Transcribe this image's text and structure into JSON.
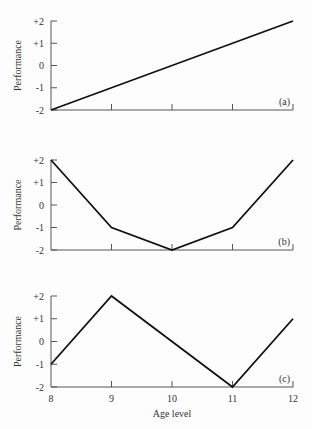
{
  "chart_data": [
    {
      "type": "line",
      "panel_label": "(a)",
      "x": [
        8,
        9,
        10,
        11,
        12
      ],
      "values": [
        -2,
        -1,
        0,
        1,
        2
      ],
      "xlabel": "",
      "ylabel": "Performance",
      "yticks": [
        "+2",
        "+1",
        "0",
        "-1",
        "-2"
      ],
      "ylim": [
        -2,
        2
      ],
      "xlim": [
        8,
        12
      ],
      "grid": false
    },
    {
      "type": "line",
      "panel_label": "(b)",
      "x": [
        8,
        9,
        10,
        11,
        12
      ],
      "values": [
        2,
        -1,
        -2,
        -1,
        2
      ],
      "xlabel": "",
      "ylabel": "Performance",
      "yticks": [
        "+2",
        "+1",
        "0",
        "-1",
        "-2"
      ],
      "ylim": [
        -2,
        2
      ],
      "xlim": [
        8,
        12
      ],
      "grid": false
    },
    {
      "type": "line",
      "panel_label": "(c)",
      "x": [
        8,
        9,
        10,
        11,
        12
      ],
      "values": [
        -1,
        2,
        0,
        -2,
        1
      ],
      "xlabel": "Age level",
      "ylabel": "Performance",
      "yticks": [
        "+2",
        "+1",
        "0",
        "-1",
        "-2"
      ],
      "xticks": [
        "8",
        "9",
        "10",
        "11",
        "12"
      ],
      "ylim": [
        -2,
        2
      ],
      "xlim": [
        8,
        12
      ],
      "grid": false
    }
  ],
  "labels": {
    "ylabel": "Performance",
    "xlabel": "Age level",
    "yticks": [
      "+2",
      "+1",
      "0",
      "-1",
      "-2"
    ],
    "xticks": [
      "8",
      "9",
      "10",
      "11",
      "12"
    ],
    "panel_a": "(a)",
    "panel_b": "(b)",
    "panel_c": "(c)"
  },
  "colors": {
    "line": "#111111",
    "axis": "#555555",
    "background": "#fdfdfd"
  }
}
